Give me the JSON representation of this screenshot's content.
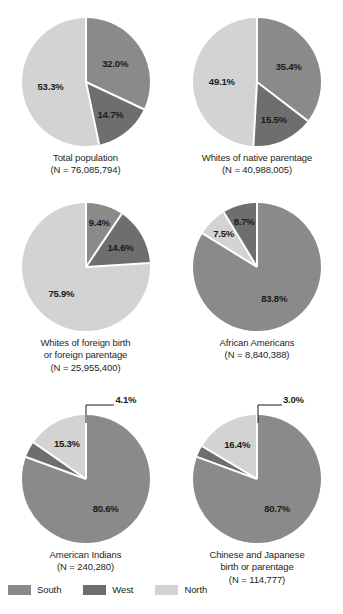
{
  "figure": {
    "type": "pie-grid",
    "columns": 2,
    "rows": 3
  },
  "legend": {
    "position": "bottom-left",
    "items": [
      {
        "label": "South",
        "color": "#8a8a8a"
      },
      {
        "label": "West",
        "color": "#6e6e6e"
      },
      {
        "label": "North",
        "color": "#d3d3d3"
      }
    ]
  },
  "chart_data": [
    {
      "type": "pie",
      "title": "Total population",
      "subtitle": "(N = 76,085,794)",
      "n": 76085794,
      "labels": [
        "South",
        "West",
        "North"
      ],
      "values": [
        32.0,
        14.7,
        53.3
      ],
      "value_labels": [
        "32.0%",
        "14.7%",
        "53.3%"
      ],
      "colors": [
        "#8a8a8a",
        "#6e6e6e",
        "#d3d3d3"
      ]
    },
    {
      "type": "pie",
      "title": "Whites of native parentage",
      "subtitle": "(N = 40,988,005)",
      "n": 40988005,
      "labels": [
        "South",
        "West",
        "North"
      ],
      "values": [
        35.4,
        15.5,
        49.1
      ],
      "value_labels": [
        "35.4%",
        "15.5%",
        "49.1%"
      ],
      "colors": [
        "#8a8a8a",
        "#6e6e6e",
        "#d3d3d3"
      ]
    },
    {
      "type": "pie",
      "title": "Whites of foreign birth",
      "title2": "or foreign parentage",
      "subtitle": "(N = 25,955,400)",
      "n": 25955400,
      "labels": [
        "South",
        "West",
        "North"
      ],
      "values": [
        9.4,
        14.6,
        75.9
      ],
      "value_labels": [
        "9.4%",
        "14.6%",
        "75.9%"
      ],
      "colors": [
        "#8a8a8a",
        "#6e6e6e",
        "#d3d3d3"
      ]
    },
    {
      "type": "pie",
      "title": "African Americans",
      "subtitle": "(N = 8,840,388)",
      "n": 8840388,
      "labels": [
        "South",
        "North",
        "West"
      ],
      "values": [
        83.8,
        7.5,
        8.7
      ],
      "value_labels": [
        "83.8%",
        "7.5%",
        "8.7%"
      ],
      "colors": [
        "#8a8a8a",
        "#d3d3d3",
        "#6e6e6e"
      ]
    },
    {
      "type": "pie",
      "title": "American Indians",
      "subtitle": "(N = 240,280)",
      "n": 240280,
      "labels": [
        "South",
        "West",
        "North"
      ],
      "values": [
        80.6,
        4.1,
        15.3
      ],
      "value_labels": [
        "80.6%",
        "4.1%",
        "15.3%"
      ],
      "colors": [
        "#8a8a8a",
        "#6e6e6e",
        "#d3d3d3"
      ],
      "callout": "4.1%"
    },
    {
      "type": "pie",
      "title": "Chinese and Japanese",
      "title2": "birth or parentage",
      "subtitle": "(N = 114,777)",
      "n": 114777,
      "labels": [
        "South",
        "West",
        "North"
      ],
      "values": [
        80.7,
        3.0,
        16.4
      ],
      "value_labels": [
        "80.7%",
        "3.0%",
        "16.4%"
      ],
      "colors": [
        "#8a8a8a",
        "#6e6e6e",
        "#d3d3d3"
      ],
      "callout": "3.0%"
    }
  ]
}
